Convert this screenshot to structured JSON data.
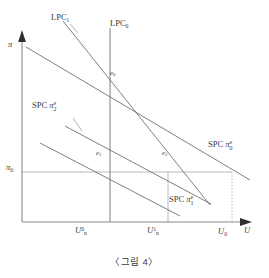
{
  "figure": {
    "caption": "〈그림 4〉",
    "title_hidden": ""
  },
  "axes": {
    "y_axis_label": "π",
    "x_axis_label": "U",
    "origin_px": [
      22,
      222
    ],
    "x_axis_end_px": [
      252,
      222
    ],
    "y_axis_top_px": [
      22,
      34
    ]
  },
  "axis_ticks": {
    "y": [
      {
        "name": "pi-zero",
        "label_main": "π",
        "label_sub": "0",
        "x_px": 10,
        "y_px": 162
      }
    ],
    "x": [
      {
        "name": "u-n-zero",
        "label_main": "U",
        "label_sub": "n",
        "label_sup": "0",
        "x_px": 82,
        "y_px": 228
      },
      {
        "name": "u-n-one",
        "label_main": "U",
        "label_sub": "n",
        "label_sup": "1",
        "x_px": 153,
        "y_px": 228
      },
      {
        "name": "u-zero",
        "label_main": "U",
        "label_sub": "0",
        "label_sup": "",
        "x_px": 222,
        "y_px": 228
      }
    ]
  },
  "curves": [
    {
      "name": "lpc-1",
      "label_main": "LPC",
      "label_sub": "1",
      "label_x_px": 52,
      "label_y_px": 14,
      "kind": "long-run-phillips-curve",
      "color": "#6f6f6f"
    },
    {
      "name": "lpc-0",
      "label_main": "LPC",
      "label_sub": "0",
      "label_x_px": 111,
      "label_y_px": 20,
      "kind": "long-run-phillips-curve",
      "color": "#6f6f6f"
    },
    {
      "name": "spc-pi-e-2",
      "label_main": "SPC",
      "label_var": "π",
      "label_sup": "e",
      "label_sub": "2",
      "label_x_px": 33,
      "label_y_px": 101,
      "kind": "short-run-phillips-curve",
      "color": "#6f6f6f"
    },
    {
      "name": "spc-pi-e-0",
      "label_main": "SPC",
      "label_var": "π",
      "label_sup": "e",
      "label_sub": "0",
      "label_x_px": 209,
      "label_y_px": 140,
      "kind": "short-run-phillips-curve",
      "color": "#6f6f6f"
    },
    {
      "name": "spc-pi-e-1",
      "label_main": "SPC",
      "label_var": "π",
      "label_sup": "e",
      "label_sub": "1",
      "label_x_px": 170,
      "label_y_px": 195,
      "kind": "short-run-phillips-curve",
      "color": "#6f6f6f"
    }
  ],
  "points": [
    {
      "name": "e-zero",
      "label_main": "e",
      "label_sub": "0",
      "label_x_px": 110,
      "label_y_px": 72,
      "at_px": [
        110,
        88
      ]
    },
    {
      "name": "e-one",
      "label_main": "e",
      "label_sub": "1",
      "label_x_px": 97,
      "label_y_px": 152,
      "at_px": [
        110,
        172
      ]
    },
    {
      "name": "e-two",
      "label_main": "e",
      "label_sub": "2",
      "label_x_px": 163,
      "label_y_px": 152,
      "at_px": [
        168,
        172
      ]
    }
  ],
  "geometry": {
    "lpc0_vertical_x_px": 110,
    "lpc1_line": {
      "x1": 63,
      "y1": 21,
      "x2": 210,
      "y2": 205
    },
    "pi0_horizontal": {
      "x1": 22,
      "y1": 172,
      "x2": 232,
      "y2": 172
    },
    "u0_vertical_dotted": {
      "x": 232,
      "y1": 172,
      "y2": 222
    },
    "un1_vertical_dotted": {
      "x": 168,
      "y1": 172,
      "y2": 222
    },
    "spc_e0_line": {
      "x1": 26,
      "y1": 47,
      "x2": 250,
      "y2": 180
    },
    "spc_e2_line": {
      "x1": 65,
      "y1": 126,
      "x2": 211,
      "y2": 204
    },
    "spc_e1_line": {
      "x1": 40,
      "y1": 143,
      "x2": 180,
      "y2": 216
    }
  },
  "colors": {
    "stroke": "#6f6f6f",
    "axis": "#7a7a7a",
    "text": "#3a3a3a",
    "background": "#ffffff",
    "guide": "#9a9a9a"
  }
}
